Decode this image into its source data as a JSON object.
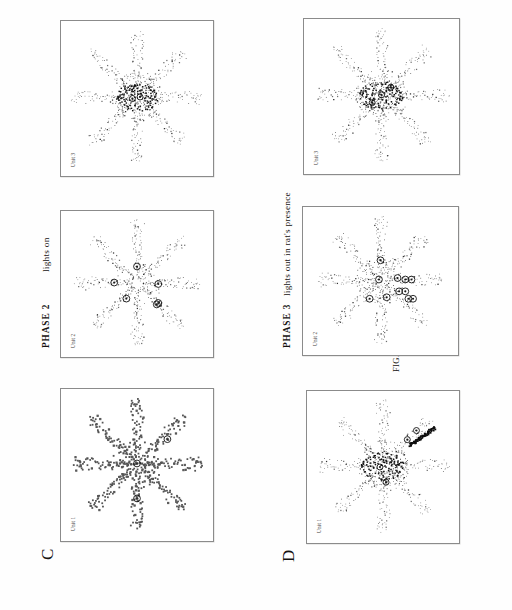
{
  "figure": {
    "caption": "FIG. 13.11",
    "background_color": "#fefefe",
    "ink_color": "#1a1a1a",
    "panel_border_color": "#8b8b8b"
  },
  "sections": [
    {
      "letter": "C",
      "phase": "PHASE  2",
      "condition": "lights  on",
      "panels": [
        {
          "unit_label": "Unit 1"
        },
        {
          "unit_label": "Unit 2"
        },
        {
          "unit_label": "Unit 3"
        }
      ]
    },
    {
      "letter": "D",
      "phase": "PHASE  3",
      "condition": "lights  out  in  rat's  presence",
      "panels": [
        {
          "unit_label": "Unit 1"
        },
        {
          "unit_label": "Unit 2"
        },
        {
          "unit_label": "Unit 3"
        }
      ]
    }
  ],
  "chart_data": {
    "type": "scatter",
    "title": "FIG. 13.11",
    "xlabel": "",
    "ylabel": "",
    "grid": false,
    "legend_position": "none",
    "arms": 8,
    "arm_angles_deg": [
      90,
      45,
      0,
      315,
      270,
      225,
      180,
      135
    ],
    "plots": [
      {
        "id": "C-unit-1",
        "section": "C",
        "phase": "PHASE  2",
        "condition": "lights  on",
        "unit_label": "Unit 1",
        "path_points": 520,
        "spike_markers": 3,
        "marker_style": "open-circle",
        "marker_positions_norm": [
          [
            0.5,
            0.49
          ],
          [
            0.7,
            0.33
          ],
          [
            0.5,
            0.72
          ]
        ],
        "center_density": "low"
      },
      {
        "id": "C-unit-2",
        "section": "C",
        "phase": "PHASE  2",
        "condition": "lights  on",
        "unit_label": "Unit 2",
        "path_points": 560,
        "spike_markers": 6,
        "marker_style": "open-circle",
        "marker_positions_norm": [
          [
            0.5,
            0.38
          ],
          [
            0.35,
            0.49
          ],
          [
            0.64,
            0.5
          ],
          [
            0.43,
            0.6
          ],
          [
            0.64,
            0.63
          ],
          [
            0.63,
            0.64
          ]
        ],
        "center_density": "low"
      },
      {
        "id": "C-unit-3",
        "section": "C",
        "phase": "PHASE  2",
        "condition": "lights  on",
        "unit_label": "Unit 3",
        "path_points": 540,
        "spike_markers": 2,
        "marker_style": "filled-cluster",
        "marker_positions_norm": [
          [
            0.47,
            0.5
          ],
          [
            0.52,
            0.49
          ]
        ],
        "center_density": "high"
      },
      {
        "id": "D-unit-1",
        "section": "D",
        "phase": "PHASE  3",
        "condition": "lights  out  in  rat's  presence",
        "unit_label": "Unit 1",
        "path_points": 530,
        "spike_markers": 4,
        "marker_style": "filled-streak",
        "marker_positions_norm": [
          [
            0.72,
            0.26
          ],
          [
            0.66,
            0.32
          ],
          [
            0.48,
            0.5
          ],
          [
            0.52,
            0.6
          ]
        ],
        "center_density": "high"
      },
      {
        "id": "D-unit-2",
        "section": "D",
        "phase": "PHASE  3",
        "condition": "lights  out  in  rat's  presence",
        "unit_label": "Unit 2",
        "path_points": 565,
        "spike_markers": 11,
        "marker_style": "open-circle",
        "marker_positions_norm": [
          [
            0.5,
            0.36
          ],
          [
            0.49,
            0.49
          ],
          [
            0.61,
            0.48
          ],
          [
            0.66,
            0.49
          ],
          [
            0.7,
            0.49
          ],
          [
            0.62,
            0.57
          ],
          [
            0.66,
            0.57
          ],
          [
            0.43,
            0.62
          ],
          [
            0.54,
            0.61
          ],
          [
            0.68,
            0.62
          ],
          [
            0.71,
            0.62
          ]
        ],
        "center_density": "medium"
      },
      {
        "id": "D-unit-3",
        "section": "D",
        "phase": "PHASE  3",
        "condition": "lights  out  in  rat's  presence",
        "unit_label": "Unit 3",
        "path_points": 545,
        "spike_markers": 3,
        "marker_style": "filled-cluster",
        "marker_positions_norm": [
          [
            0.5,
            0.49
          ],
          [
            0.56,
            0.44
          ],
          [
            0.44,
            0.54
          ]
        ],
        "center_density": "high"
      }
    ]
  }
}
